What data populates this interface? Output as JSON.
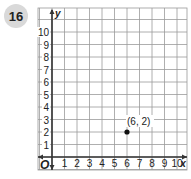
{
  "problem_number": "16",
  "chart_data": {
    "type": "scatter",
    "title": "",
    "xlabel": "x",
    "ylabel": "y",
    "xlim": [
      0,
      10
    ],
    "ylim": [
      0,
      10
    ],
    "grid": true,
    "origin_label": "O",
    "x_ticks": [
      "1",
      "2",
      "3",
      "4",
      "5",
      "6",
      "7",
      "8",
      "9",
      "10"
    ],
    "y_ticks": [
      "1",
      "2",
      "3",
      "4",
      "5",
      "6",
      "7",
      "8",
      "9",
      "10"
    ],
    "points": [
      {
        "x": 6,
        "y": 2,
        "label": "(6, 2)"
      }
    ]
  },
  "colors": {
    "grid": "#9a9a9a",
    "axis": "#333333",
    "point": "#111111",
    "badge": "#d9d9d9"
  }
}
